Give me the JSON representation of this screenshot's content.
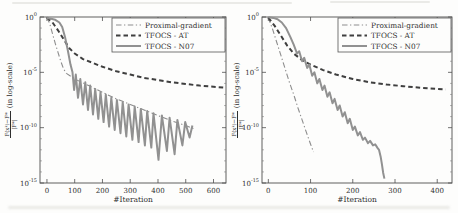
{
  "figure": {
    "background": "#fdfdfc"
  },
  "chart_data": [
    {
      "type": "line",
      "title": "",
      "xlabel": "#Iteration",
      "ylabel": {
        "num": "F(xᵏ)−F*",
        "den": "|F*|",
        "suffix": "(in log-scale)"
      },
      "y_scale": "log10",
      "points_format": "[iteration, log10(relative objective error)]",
      "xlim": [
        -25,
        645
      ],
      "xticks": [
        0,
        100,
        200,
        300,
        400,
        500,
        600
      ],
      "ylim_exponents": [
        -15,
        0
      ],
      "yticks_exponents": [
        0,
        -5,
        -10,
        -15
      ],
      "grid": false,
      "legend_position": "top-right",
      "series": [
        {
          "name": "Proximal-gradient",
          "style": "dashdot",
          "color": "#8d8d8d",
          "points": [
            [
              0,
              -0.05
            ],
            [
              10,
              -0.6
            ],
            [
              20,
              -1.5
            ],
            [
              30,
              -2.4
            ],
            [
              40,
              -3.2
            ],
            [
              50,
              -4.0
            ],
            [
              60,
              -4.7
            ],
            [
              70,
              -5.1
            ],
            [
              100,
              -5.6
            ],
            [
              150,
              -6.2
            ],
            [
              200,
              -6.8
            ],
            [
              250,
              -7.4
            ],
            [
              300,
              -7.9
            ],
            [
              350,
              -8.4
            ],
            [
              400,
              -8.9
            ],
            [
              450,
              -9.4
            ],
            [
              500,
              -9.8
            ],
            [
              530,
              -10.1
            ]
          ]
        },
        {
          "name": "TFOCS - AT",
          "style": "dashed",
          "color": "#3f3f3f",
          "points": [
            [
              0,
              -0.05
            ],
            [
              20,
              -0.5
            ],
            [
              40,
              -1.2
            ],
            [
              60,
              -2.0
            ],
            [
              80,
              -2.8
            ],
            [
              100,
              -3.3
            ],
            [
              130,
              -3.8
            ],
            [
              160,
              -4.1
            ],
            [
              200,
              -4.5
            ],
            [
              250,
              -4.9
            ],
            [
              300,
              -5.2
            ],
            [
              350,
              -5.5
            ],
            [
              400,
              -5.7
            ],
            [
              450,
              -5.9
            ],
            [
              500,
              -6.05
            ],
            [
              550,
              -6.2
            ],
            [
              600,
              -6.3
            ],
            [
              645,
              -6.4
            ]
          ]
        },
        {
          "name": "TFOCS - N07",
          "style": "solid",
          "color": "#919191",
          "points": [
            [
              0,
              -0.1
            ],
            [
              15,
              -0.15
            ],
            [
              30,
              -0.25
            ],
            [
              45,
              -0.5
            ],
            [
              55,
              -0.9
            ],
            [
              65,
              -1.8
            ],
            [
              75,
              -3.0
            ],
            [
              85,
              -4.3
            ],
            [
              92,
              -5.0
            ],
            [
              98,
              -6.6
            ],
            [
              104,
              -5.2
            ],
            [
              112,
              -7.3
            ],
            [
              120,
              -5.6
            ],
            [
              130,
              -7.9
            ],
            [
              138,
              -5.9
            ],
            [
              148,
              -8.4
            ],
            [
              156,
              -6.2
            ],
            [
              166,
              -8.8
            ],
            [
              174,
              -6.5
            ],
            [
              185,
              -9.2
            ],
            [
              193,
              -6.8
            ],
            [
              204,
              -9.5
            ],
            [
              212,
              -7.0
            ],
            [
              224,
              -9.9
            ],
            [
              232,
              -7.3
            ],
            [
              244,
              -10.2
            ],
            [
              252,
              -7.5
            ],
            [
              265,
              -10.5
            ],
            [
              273,
              -7.7
            ],
            [
              286,
              -10.8
            ],
            [
              294,
              -7.9
            ],
            [
              308,
              -11.1
            ],
            [
              316,
              -8.1
            ],
            [
              330,
              -11.3
            ],
            [
              338,
              -8.3
            ],
            [
              353,
              -11.6
            ],
            [
              361,
              -8.5
            ],
            [
              376,
              -11.8
            ],
            [
              384,
              -8.7
            ],
            [
              402,
              -12.9
            ],
            [
              414,
              -8.9
            ],
            [
              432,
              -12.1
            ],
            [
              442,
              -9.1
            ],
            [
              460,
              -12.4
            ],
            [
              470,
              -9.3
            ],
            [
              488,
              -11.6
            ],
            [
              498,
              -9.5
            ],
            [
              514,
              -10.9
            ],
            [
              524,
              -9.8
            ]
          ]
        }
      ]
    },
    {
      "type": "line",
      "title": "",
      "xlabel": "#Iteration",
      "ylabel": {
        "num": "F(xᵏ)−F*",
        "den": "|F*|",
        "suffix": "(in log-scale)"
      },
      "y_scale": "log10",
      "points_format": "[iteration, log10(relative objective error)]",
      "xlim": [
        -15,
        435
      ],
      "xticks": [
        0,
        100,
        200,
        300,
        400
      ],
      "ylim_exponents": [
        -15,
        0
      ],
      "yticks_exponents": [
        0,
        -5,
        -10,
        -15
      ],
      "grid": false,
      "legend_position": "top-right",
      "series": [
        {
          "name": "Proximal-gradient",
          "style": "dashdot",
          "color": "#8d8d8d",
          "points": [
            [
              0,
              -0.05
            ],
            [
              10,
              -1.1
            ],
            [
              20,
              -2.3
            ],
            [
              30,
              -3.5
            ],
            [
              40,
              -4.7
            ],
            [
              50,
              -5.9
            ],
            [
              60,
              -7.0
            ],
            [
              70,
              -8.2
            ],
            [
              80,
              -9.3
            ],
            [
              90,
              -10.4
            ],
            [
              100,
              -11.5
            ],
            [
              107,
              -12.2
            ]
          ]
        },
        {
          "name": "TFOCS - AT",
          "style": "dashed",
          "color": "#3f3f3f",
          "points": [
            [
              0,
              -0.05
            ],
            [
              15,
              -0.8
            ],
            [
              30,
              -1.7
            ],
            [
              45,
              -2.6
            ],
            [
              60,
              -3.3
            ],
            [
              80,
              -3.9
            ],
            [
              100,
              -4.3
            ],
            [
              130,
              -4.8
            ],
            [
              160,
              -5.2
            ],
            [
              200,
              -5.6
            ],
            [
              240,
              -5.9
            ],
            [
              280,
              -6.1
            ],
            [
              320,
              -6.25
            ],
            [
              360,
              -6.4
            ],
            [
              420,
              -6.55
            ]
          ]
        },
        {
          "name": "TFOCS - N07",
          "style": "solid",
          "color": "#919191",
          "points": [
            [
              0,
              -0.02
            ],
            [
              12,
              -0.08
            ],
            [
              22,
              -0.2
            ],
            [
              32,
              -0.5
            ],
            [
              42,
              -1.0
            ],
            [
              52,
              -1.8
            ],
            [
              60,
              -2.5
            ],
            [
              68,
              -3.3
            ],
            [
              73,
              -3.1
            ],
            [
              80,
              -4.0
            ],
            [
              85,
              -3.7
            ],
            [
              92,
              -4.6
            ],
            [
              97,
              -4.3
            ],
            [
              104,
              -5.3
            ],
            [
              109,
              -5.0
            ],
            [
              116,
              -6.0
            ],
            [
              121,
              -5.6
            ],
            [
              128,
              -6.6
            ],
            [
              133,
              -6.2
            ],
            [
              140,
              -7.2
            ],
            [
              145,
              -6.8
            ],
            [
              152,
              -7.8
            ],
            [
              157,
              -7.4
            ],
            [
              164,
              -8.4
            ],
            [
              169,
              -8.0
            ],
            [
              176,
              -9.0
            ],
            [
              181,
              -8.6
            ],
            [
              188,
              -9.6
            ],
            [
              193,
              -9.2
            ],
            [
              200,
              -10.2
            ],
            [
              205,
              -9.9
            ],
            [
              212,
              -10.7
            ],
            [
              217,
              -10.4
            ],
            [
              224,
              -11.1
            ],
            [
              229,
              -10.9
            ],
            [
              236,
              -11.4
            ],
            [
              241,
              -11.2
            ],
            [
              248,
              -11.6
            ],
            [
              253,
              -11.5
            ],
            [
              258,
              -11.8
            ],
            [
              262,
              -12.0
            ],
            [
              266,
              -12.6
            ],
            [
              269,
              -13.3
            ],
            [
              272,
              -14.1
            ],
            [
              275,
              -14.6
            ]
          ]
        }
      ]
    }
  ]
}
